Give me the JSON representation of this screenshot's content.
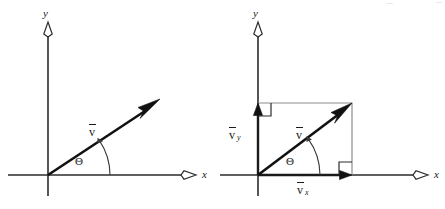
{
  "figure": {
    "width": 445,
    "height": 209,
    "background": "#ffffff",
    "ink_color": "#1a1a1a",
    "construction_color": "#8d8d8d"
  },
  "panels": [
    {
      "id": "left",
      "name": "vector-only-diagram",
      "origin": {
        "x": 48,
        "y": 175
      },
      "axes": {
        "y_label": "y",
        "x_label": "x",
        "y_top": 22,
        "y_bottom": 196,
        "x_left": 8,
        "x_right": 196
      },
      "vector": {
        "label": "v",
        "overbar": true,
        "tip": {
          "x": 158,
          "y": 100
        },
        "angle_deg": 29
      },
      "angle": {
        "label": "Θ",
        "radius": 62
      }
    },
    {
      "id": "right",
      "name": "vector-components-diagram",
      "origin": {
        "x": 258,
        "y": 175
      },
      "axes": {
        "y_label": "y",
        "x_label": "x",
        "y_top": 22,
        "y_bottom": 196,
        "x_left": 220,
        "x_right": 428
      },
      "vector": {
        "label": "v",
        "overbar": true,
        "tip": {
          "x": 352,
          "y": 103
        },
        "angle_deg": 36
      },
      "components": [
        {
          "name": "y-component",
          "label": "v",
          "subscript": "y",
          "overbar": true,
          "from": {
            "x": 258,
            "y": 175
          },
          "to": {
            "x": 258,
            "y": 103
          }
        },
        {
          "name": "x-component",
          "label": "v",
          "subscript": "x",
          "overbar": true,
          "from": {
            "x": 258,
            "y": 175
          },
          "to": {
            "x": 352,
            "y": 175
          }
        }
      ],
      "angle": {
        "label": "Θ",
        "radius": 62
      },
      "right_angle_markers": [
        {
          "name": "upper-left-right-angle",
          "x": 258,
          "y": 103
        },
        {
          "name": "lower-right-right-angle",
          "x": 352,
          "y": 175
        }
      ],
      "construction_box": {
        "name": "component-rectangle",
        "corners": [
          {
            "x": 258,
            "y": 103
          },
          {
            "x": 352,
            "y": 103
          },
          {
            "x": 352,
            "y": 175
          }
        ]
      }
    }
  ]
}
